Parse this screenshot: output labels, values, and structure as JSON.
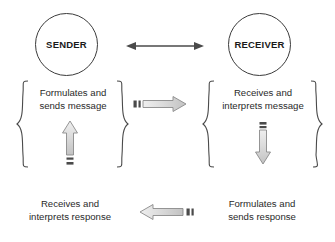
{
  "diagram": {
    "nodes": [
      {
        "id": "sender",
        "label": "SENDER"
      },
      {
        "id": "receiver",
        "label": "RECEIVER"
      }
    ],
    "blocks": [
      {
        "id": "sender-action",
        "line1": "Formulates and",
        "line2": "sends message"
      },
      {
        "id": "receiver-action",
        "line1": "Receives and",
        "line2": "interprets message"
      }
    ],
    "captions": [
      {
        "id": "receiver-response",
        "line1": "Receives and",
        "line2": "interprets response"
      },
      {
        "id": "sender-response",
        "line1": "Formulates and",
        "line2": "sends response"
      }
    ],
    "connectors": [
      {
        "id": "bidirectional-link",
        "icon": "double-headed-arrow-icon",
        "direction": "both"
      },
      {
        "id": "message-channel",
        "icon": "block-arrow-right-icon",
        "direction": "right"
      },
      {
        "id": "response-channel",
        "icon": "block-arrow-left-icon",
        "direction": "left"
      },
      {
        "id": "sender-flow",
        "icon": "block-arrow-up-icon",
        "direction": "up"
      },
      {
        "id": "receiver-flow",
        "icon": "block-arrow-down-icon",
        "direction": "down"
      }
    ],
    "colors": {
      "stroke": "#3b3b3b",
      "text": "#2a2a2a",
      "arrow_fill": "#d4d4d4",
      "arrow_stroke": "#8a8a8a",
      "tick": "#4a4a4a",
      "background": "#ffffff"
    }
  }
}
